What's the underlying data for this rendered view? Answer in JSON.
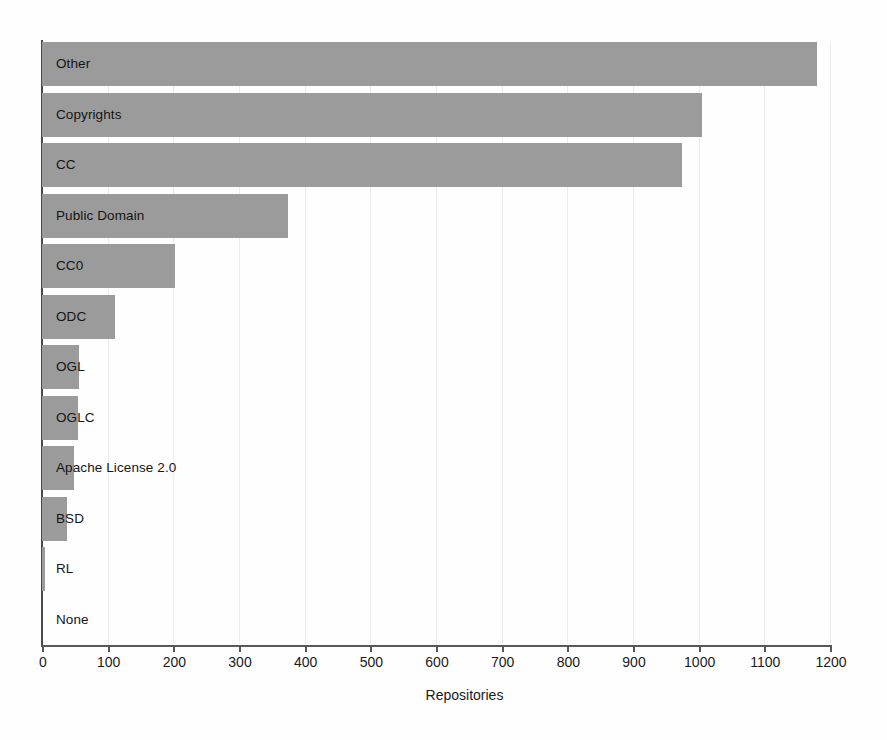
{
  "chart_data": {
    "type": "bar",
    "orientation": "horizontal",
    "title": "",
    "xlabel": "Repositories",
    "ylabel": "",
    "xlim": [
      0,
      1200
    ],
    "xticks": [
      0,
      100,
      200,
      300,
      400,
      500,
      600,
      700,
      800,
      900,
      1000,
      1100,
      1200
    ],
    "xtick_labels": [
      "0",
      "100",
      "200",
      "300",
      "400",
      "500",
      "600",
      "700",
      "800",
      "900",
      "1000",
      "1100",
      "1200"
    ],
    "grid": "vertical",
    "legend": "none",
    "bar_color": "#9b9b9b",
    "categories": [
      "Other",
      "Copyrights",
      "CC",
      "Public Domain",
      "CC0",
      "ODC",
      "OGL",
      "OGLC",
      "Apache License 2.0",
      "BSD",
      "RL",
      "None"
    ],
    "values": [
      1180,
      1005,
      975,
      374,
      202,
      111,
      56,
      55,
      49,
      38,
      5,
      0
    ]
  }
}
